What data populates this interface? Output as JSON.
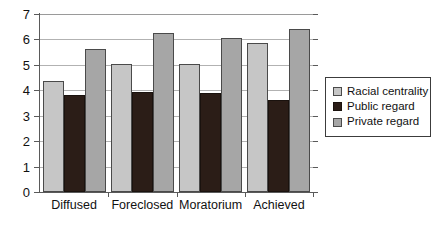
{
  "chart_data": {
    "type": "bar",
    "title": "",
    "subtitle": "",
    "xlabel": "",
    "ylabel": "",
    "ylim": [
      0,
      7
    ],
    "yticks": [
      0,
      1,
      2,
      3,
      4,
      5,
      6,
      7
    ],
    "grid": true,
    "legend_position": "right",
    "categories": [
      "Diffused",
      "Foreclosed",
      "Moratorium",
      "Achieved"
    ],
    "series": [
      {
        "name": "Racial centrality",
        "color": "#c6c6c6",
        "values": [
          4.35,
          5.03,
          5.05,
          5.85
        ]
      },
      {
        "name": "Public regard",
        "color": "#2b1d17",
        "values": [
          3.82,
          3.92,
          3.9,
          3.6
        ]
      },
      {
        "name": "Private regard",
        "color": "#a6a6a6",
        "values": [
          5.62,
          6.25,
          6.06,
          6.42
        ]
      }
    ]
  },
  "axes": {
    "y_tick_labels": [
      "0",
      "1",
      "2",
      "3",
      "4",
      "5",
      "6",
      "7"
    ]
  },
  "legend": {
    "entries": [
      {
        "label": "Racial centrality"
      },
      {
        "label": "Public regard"
      },
      {
        "label": "Private regard"
      }
    ]
  }
}
